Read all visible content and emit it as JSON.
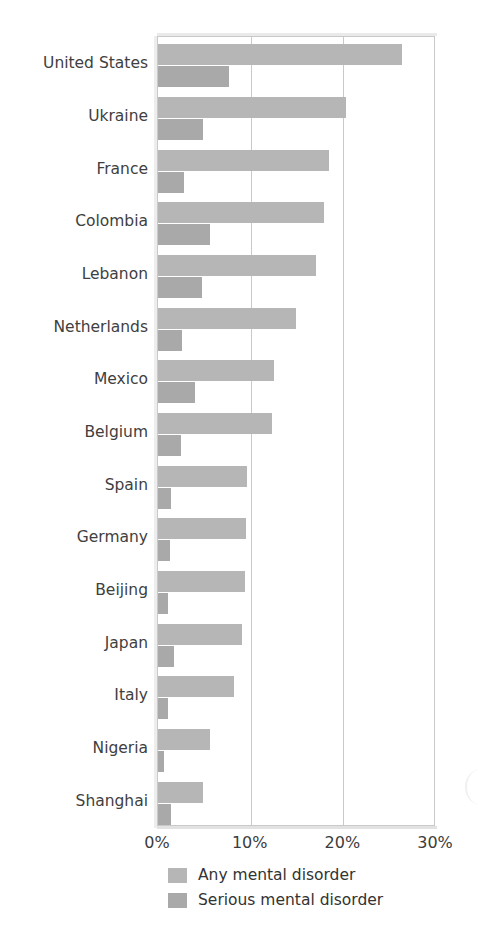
{
  "chart_data": {
    "type": "bar",
    "orientation": "horizontal",
    "title": "",
    "xlabel": "",
    "ylabel": "",
    "xlim": [
      0,
      30
    ],
    "xunit": "%",
    "grid": true,
    "legend_position": "bottom-left",
    "xticks": [
      "0%",
      "10%",
      "20%",
      "30%"
    ],
    "xtick_values": [
      0,
      10,
      20,
      30
    ],
    "categories": [
      "United States",
      "Ukraine",
      "France",
      "Colombia",
      "Lebanon",
      "Netherlands",
      "Mexico",
      "Belgium",
      "Spain",
      "Germany",
      "Beijing",
      "Japan",
      "Italy",
      "Nigeria",
      "Shanghai"
    ],
    "series": [
      {
        "name": "Any mental disorder",
        "color": "#b6b6b6",
        "values": [
          26.3,
          20.3,
          18.4,
          17.9,
          17.0,
          14.9,
          12.5,
          12.3,
          9.6,
          9.5,
          9.4,
          9.1,
          8.2,
          5.6,
          4.9
        ]
      },
      {
        "name": "Serious mental disorder",
        "color": "#a9a9a9",
        "values": [
          7.7,
          4.9,
          2.8,
          5.6,
          4.8,
          2.6,
          4.0,
          2.5,
          1.4,
          1.3,
          1.1,
          1.7,
          1.1,
          0.7,
          1.4
        ]
      }
    ]
  },
  "legend": {
    "items": [
      {
        "label": "Any mental disorder",
        "swatch": "any"
      },
      {
        "label": "Serious mental disorder",
        "swatch": "serious"
      }
    ]
  },
  "title_remnant": ""
}
